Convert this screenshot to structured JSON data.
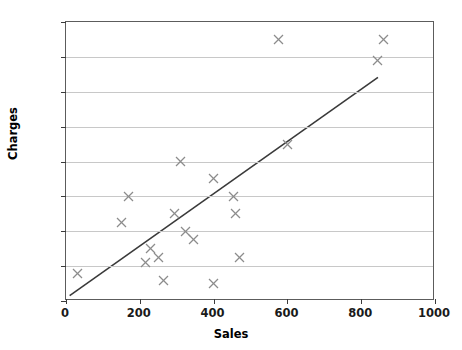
{
  "chart_data": {
    "type": "scatter",
    "title": "",
    "xlabel": "Sales",
    "ylabel": "Charges",
    "xlim": [
      0,
      1000
    ],
    "ylim": [
      0,
      16
    ],
    "xticks": [
      0,
      200,
      400,
      600,
      800,
      1000
    ],
    "yticks": [
      0,
      2,
      4,
      6,
      8,
      10,
      12,
      14,
      16
    ],
    "xtick_labels": [
      "0",
      "200",
      "400",
      "600",
      "800",
      "1000"
    ],
    "ytick_labels": [
      "0",
      "2",
      "4",
      "6",
      "8",
      "10",
      "12",
      "14",
      "16"
    ],
    "grid": "horizontal",
    "legend": "none",
    "marker_style": "x",
    "marker_color": "#8c8c8c",
    "line_color": "#3a3a3a",
    "points": [
      {
        "x": 30,
        "y": 1.6
      },
      {
        "x": 150,
        "y": 4.5
      },
      {
        "x": 170,
        "y": 6.0
      },
      {
        "x": 215,
        "y": 2.2
      },
      {
        "x": 230,
        "y": 3.0
      },
      {
        "x": 250,
        "y": 2.5
      },
      {
        "x": 265,
        "y": 1.2
      },
      {
        "x": 295,
        "y": 5.0
      },
      {
        "x": 310,
        "y": 8.0
      },
      {
        "x": 325,
        "y": 4.0
      },
      {
        "x": 345,
        "y": 3.5
      },
      {
        "x": 400,
        "y": 7.0
      },
      {
        "x": 400,
        "y": 1.0
      },
      {
        "x": 455,
        "y": 6.0
      },
      {
        "x": 460,
        "y": 5.0
      },
      {
        "x": 470,
        "y": 2.5
      },
      {
        "x": 575,
        "y": 15.0
      },
      {
        "x": 600,
        "y": 9.0
      },
      {
        "x": 845,
        "y": 13.8
      },
      {
        "x": 860,
        "y": 15.0
      }
    ],
    "trendline": {
      "x_start": 10,
      "y_start": 0.2,
      "x_end": 850,
      "y_end": 12.8
    }
  }
}
